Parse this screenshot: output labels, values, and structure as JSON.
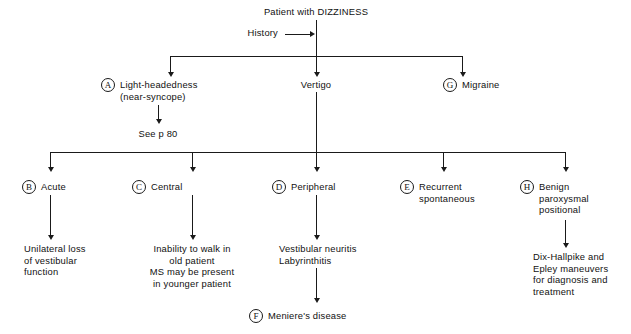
{
  "diagram": {
    "title": "Patient with DIZZINESS",
    "history_label": "History",
    "root": "Patient with DIZZINESS",
    "level1": [
      {
        "badge": "A",
        "label": "Light-headedness\n(near-syncope)"
      },
      {
        "badge": "",
        "label": "Vertigo"
      },
      {
        "badge": "G",
        "label": "Migraine"
      }
    ],
    "see_page": "See p 80",
    "level2": [
      {
        "badge": "B",
        "label": "Acute"
      },
      {
        "badge": "C",
        "label": "Central"
      },
      {
        "badge": "D",
        "label": "Peripheral"
      },
      {
        "badge": "E",
        "label": "Recurrent\nspontaneous"
      },
      {
        "badge": "H",
        "label": "Benign\nparoxysmal\npositional"
      }
    ],
    "level3": [
      {
        "for": "B",
        "label": "Unilateral loss\nof vestibular\nfunction"
      },
      {
        "for": "C",
        "label": "Inability to walk in\nold patient\nMS may be present\nin younger patient"
      },
      {
        "for": "D",
        "label": "Vestibular neuritis\nLabyrinthitis"
      },
      {
        "for": "H",
        "label": "Dix-Hallpike and\nEpley maneuvers\nfor diagnosis and\ntreatment"
      }
    ],
    "terminal": {
      "badge": "F",
      "label": "Meniere's disease"
    },
    "colors": {
      "ink": "#1a1a1a",
      "background": "#ffffff"
    }
  }
}
